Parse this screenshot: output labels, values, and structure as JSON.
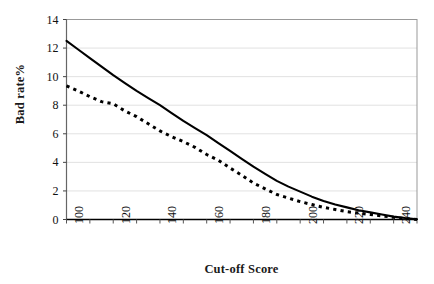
{
  "chart_data": {
    "type": "line",
    "title": "",
    "xlabel": "Cut-off Score",
    "ylabel": "Bad rate%",
    "xlim": [
      100,
      250
    ],
    "ylim": [
      0,
      14
    ],
    "xticks": [
      100,
      120,
      140,
      160,
      180,
      200,
      220,
      240
    ],
    "xticks_minor_step": 10,
    "yticks": [
      0,
      2,
      4,
      6,
      8,
      10,
      12,
      14
    ],
    "grid": "horizontal",
    "grid_color": "#d9d9d9",
    "legend": "none",
    "axis_color": "#000000",
    "series": [
      {
        "name": "solid-curve",
        "style": "solid",
        "color": "#000000",
        "x": [
          100,
          105,
          110,
          115,
          120,
          125,
          130,
          135,
          140,
          145,
          150,
          155,
          160,
          165,
          170,
          175,
          180,
          185,
          190,
          195,
          200,
          205,
          210,
          215,
          220,
          225,
          230,
          235,
          240,
          245,
          250
        ],
        "values": [
          12.5,
          11.9,
          11.3,
          10.7,
          10.1,
          9.55,
          9.0,
          8.5,
          8.0,
          7.45,
          6.9,
          6.4,
          5.9,
          5.35,
          4.8,
          4.25,
          3.7,
          3.2,
          2.7,
          2.3,
          1.95,
          1.6,
          1.3,
          1.05,
          0.85,
          0.65,
          0.5,
          0.35,
          0.2,
          0.1,
          0.02
        ]
      },
      {
        "name": "dashed-curve",
        "style": "dashed",
        "color": "#000000",
        "x": [
          100,
          105,
          110,
          115,
          120,
          125,
          130,
          135,
          140,
          145,
          150,
          155,
          160,
          165,
          170,
          175,
          180,
          185,
          190,
          195,
          200,
          205,
          210,
          215,
          220,
          225,
          230,
          235,
          240,
          245,
          250
        ],
        "values": [
          9.35,
          9.0,
          8.6,
          8.25,
          8.1,
          7.6,
          7.2,
          6.7,
          6.2,
          5.8,
          5.45,
          5.05,
          4.55,
          4.15,
          3.6,
          3.1,
          2.55,
          2.15,
          1.75,
          1.5,
          1.25,
          1.05,
          0.85,
          0.7,
          0.55,
          0.45,
          0.35,
          0.25,
          0.15,
          0.07,
          0.0
        ]
      }
    ]
  }
}
